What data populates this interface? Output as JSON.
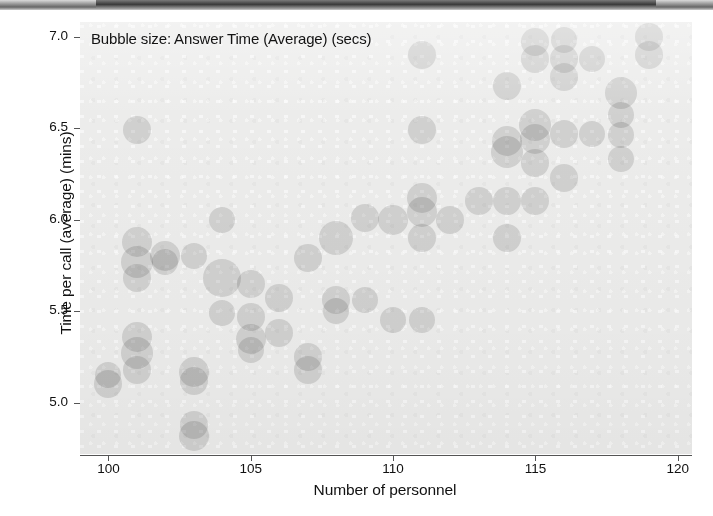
{
  "chart_data": {
    "type": "scatter",
    "title": "Bubble size: Answer Time (Average) (secs)",
    "xlabel": "Number of personnel",
    "ylabel": "Time per call (average) (mins)",
    "xlim": [
      99,
      120.5
    ],
    "ylim": [
      4.72,
      7.08
    ],
    "xticks": [
      100,
      105,
      110,
      115,
      120
    ],
    "xtick_labels": [
      "100",
      "105",
      "110",
      "115",
      "120"
    ],
    "yticks": [
      5.0,
      5.5,
      6.0,
      6.5,
      7.0
    ],
    "ytick_labels": [
      "5.0",
      "5.5",
      "6.0",
      "6.5",
      "7.0"
    ],
    "grid": false,
    "legend": "none",
    "size_encodes": "Answer Time (Average) (secs)",
    "bubble_color": "#9a9a9a",
    "plot_background": "#ececeb",
    "points": [
      {
        "x": 100,
        "y": 5.1,
        "r": 14
      },
      {
        "x": 100,
        "y": 5.15,
        "r": 13
      },
      {
        "x": 101,
        "y": 6.49,
        "r": 14
      },
      {
        "x": 101,
        "y": 5.88,
        "r": 15
      },
      {
        "x": 101,
        "y": 5.77,
        "r": 16
      },
      {
        "x": 101,
        "y": 5.68,
        "r": 14
      },
      {
        "x": 101,
        "y": 5.36,
        "r": 15
      },
      {
        "x": 101,
        "y": 5.27,
        "r": 16
      },
      {
        "x": 101,
        "y": 5.18,
        "r": 14
      },
      {
        "x": 102,
        "y": 5.8,
        "r": 15
      },
      {
        "x": 102,
        "y": 5.77,
        "r": 13
      },
      {
        "x": 103,
        "y": 5.8,
        "r": 13
      },
      {
        "x": 103,
        "y": 5.17,
        "r": 15
      },
      {
        "x": 103,
        "y": 5.12,
        "r": 14
      },
      {
        "x": 103,
        "y": 4.88,
        "r": 14
      },
      {
        "x": 103,
        "y": 4.82,
        "r": 15
      },
      {
        "x": 104,
        "y": 6.0,
        "r": 13
      },
      {
        "x": 104,
        "y": 5.68,
        "r": 19
      },
      {
        "x": 104,
        "y": 5.49,
        "r": 13
      },
      {
        "x": 105,
        "y": 5.65,
        "r": 14
      },
      {
        "x": 105,
        "y": 5.47,
        "r": 14
      },
      {
        "x": 105,
        "y": 5.35,
        "r": 15
      },
      {
        "x": 105,
        "y": 5.29,
        "r": 13
      },
      {
        "x": 106,
        "y": 5.57,
        "r": 14
      },
      {
        "x": 106,
        "y": 5.38,
        "r": 14
      },
      {
        "x": 107,
        "y": 5.79,
        "r": 14
      },
      {
        "x": 107,
        "y": 5.25,
        "r": 14
      },
      {
        "x": 107,
        "y": 5.18,
        "r": 14
      },
      {
        "x": 108,
        "y": 5.9,
        "r": 17
      },
      {
        "x": 108,
        "y": 5.56,
        "r": 14
      },
      {
        "x": 108,
        "y": 5.5,
        "r": 13
      },
      {
        "x": 109,
        "y": 6.01,
        "r": 14
      },
      {
        "x": 109,
        "y": 5.56,
        "r": 13
      },
      {
        "x": 110,
        "y": 6.0,
        "r": 15
      },
      {
        "x": 110,
        "y": 5.45,
        "r": 13
      },
      {
        "x": 111,
        "y": 6.9,
        "r": 14
      },
      {
        "x": 111,
        "y": 6.49,
        "r": 14
      },
      {
        "x": 111,
        "y": 6.12,
        "r": 15
      },
      {
        "x": 111,
        "y": 6.04,
        "r": 15
      },
      {
        "x": 111,
        "y": 5.9,
        "r": 14
      },
      {
        "x": 111,
        "y": 5.45,
        "r": 13
      },
      {
        "x": 112,
        "y": 6.0,
        "r": 14
      },
      {
        "x": 113,
        "y": 6.1,
        "r": 14
      },
      {
        "x": 114,
        "y": 6.73,
        "r": 14
      },
      {
        "x": 114,
        "y": 6.43,
        "r": 15
      },
      {
        "x": 114,
        "y": 6.37,
        "r": 16
      },
      {
        "x": 114,
        "y": 6.1,
        "r": 14
      },
      {
        "x": 114,
        "y": 5.9,
        "r": 14
      },
      {
        "x": 115,
        "y": 6.97,
        "r": 14
      },
      {
        "x": 115,
        "y": 6.88,
        "r": 14
      },
      {
        "x": 115,
        "y": 6.52,
        "r": 16
      },
      {
        "x": 115,
        "y": 6.44,
        "r": 15
      },
      {
        "x": 115,
        "y": 6.31,
        "r": 14
      },
      {
        "x": 115,
        "y": 6.1,
        "r": 14
      },
      {
        "x": 116,
        "y": 6.98,
        "r": 13
      },
      {
        "x": 116,
        "y": 6.88,
        "r": 14
      },
      {
        "x": 116,
        "y": 6.78,
        "r": 14
      },
      {
        "x": 116,
        "y": 6.47,
        "r": 14
      },
      {
        "x": 116,
        "y": 6.23,
        "r": 14
      },
      {
        "x": 117,
        "y": 6.88,
        "r": 13
      },
      {
        "x": 117,
        "y": 6.47,
        "r": 13
      },
      {
        "x": 118,
        "y": 6.69,
        "r": 16
      },
      {
        "x": 118,
        "y": 6.57,
        "r": 13
      },
      {
        "x": 118,
        "y": 6.46,
        "r": 13
      },
      {
        "x": 118,
        "y": 6.33,
        "r": 13
      },
      {
        "x": 119,
        "y": 7.0,
        "r": 14
      },
      {
        "x": 119,
        "y": 6.9,
        "r": 14
      }
    ]
  }
}
